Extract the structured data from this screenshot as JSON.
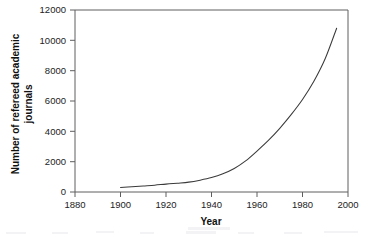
{
  "chart_data": {
    "type": "line",
    "title": "",
    "xlabel": "Year",
    "ylabel": "Number of refereed academic journals",
    "ylabel_line1": "Number of refereed academic",
    "ylabel_line2": "journals",
    "xlim": [
      1880,
      2000
    ],
    "ylim": [
      0,
      12000
    ],
    "xticks": [
      1880,
      1900,
      1920,
      1940,
      1960,
      1980,
      2000
    ],
    "yticks": [
      0,
      2000,
      4000,
      6000,
      8000,
      10000,
      12000
    ],
    "xtick_labels": [
      "1880",
      "1900",
      "1920",
      "1940",
      "1960",
      "1980",
      "2000"
    ],
    "ytick_labels": [
      "0",
      "2000",
      "4000",
      "6000",
      "8000",
      "10000",
      "12000"
    ],
    "grid": false,
    "legend": false,
    "legend_position": "none",
    "line_color": "#3a3a3a",
    "series": [
      {
        "name": "Refereed academic journals",
        "x": [
          1900,
          1905,
          1910,
          1915,
          1920,
          1925,
          1930,
          1935,
          1940,
          1945,
          1950,
          1955,
          1960,
          1965,
          1970,
          1975,
          1980,
          1985,
          1990,
          1995
        ],
        "values": [
          300,
          350,
          400,
          450,
          520,
          580,
          650,
          780,
          950,
          1200,
          1550,
          2050,
          2700,
          3400,
          4200,
          5100,
          6100,
          7300,
          8800,
          10800
        ]
      }
    ]
  },
  "axes": {
    "x_title": "Year",
    "y_title_line1": "Number of refereed academic",
    "y_title_line2": "journals"
  }
}
